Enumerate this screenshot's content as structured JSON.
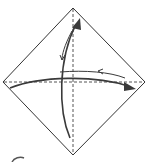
{
  "diagram": {
    "type": "origami-fold-diagram",
    "colors": {
      "paper_outline": "#333333",
      "crease": "#555555",
      "arrow": "#3a3a3a",
      "background": "#ffffff"
    },
    "paper": {
      "top": [
        73,
        8
      ],
      "right": [
        145,
        82
      ],
      "bottom": [
        73,
        155
      ],
      "left": [
        3,
        82
      ]
    },
    "creases": [
      {
        "name": "horizontal",
        "from": [
          3,
          82
        ],
        "to": [
          145,
          82
        ],
        "style": "dashed"
      },
      {
        "name": "vertical",
        "from": [
          73,
          8
        ],
        "to": [
          73,
          155
        ],
        "style": "dashed"
      }
    ],
    "arrows": [
      {
        "name": "fold-up-arrow",
        "direction": "bottom-to-top",
        "kind": "fold-and-unfold"
      },
      {
        "name": "fold-right-arrow",
        "direction": "left-to-right",
        "kind": "fold-and-unfold"
      }
    ]
  }
}
